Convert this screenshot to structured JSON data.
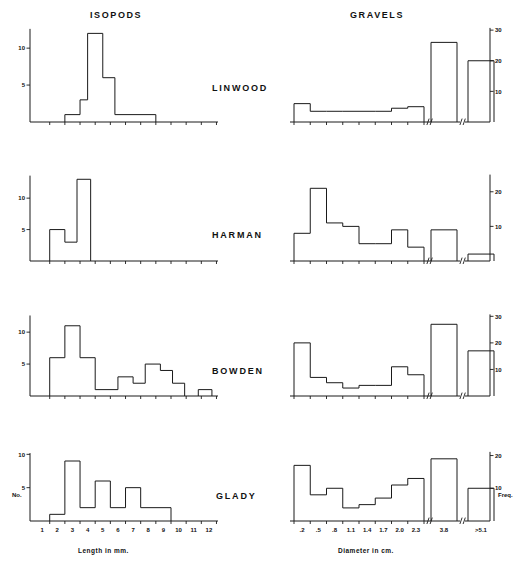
{
  "figure": {
    "column_titles": {
      "left": "ISOPODS",
      "right": "GRAVELS"
    },
    "sites": [
      "LINWOOD",
      "HARMAN",
      "BOWDEN",
      "GLADY"
    ],
    "left_axis_title": "Length in mm.",
    "right_axis_title": "Diameter in cm.",
    "left_y_label": "No.",
    "right_y_label": "Freq."
  },
  "chart_data": [
    {
      "type": "bar",
      "title": "ISOPODS",
      "site": "LINWOOD",
      "xlabel": "Length in mm.",
      "ylabel": "No.",
      "xlim": [
        0,
        12.5
      ],
      "ylim": [
        0,
        13
      ],
      "ytick_labels": [
        "5",
        "10"
      ],
      "ytick_values": [
        5,
        10
      ],
      "xtick_labels": [
        "1",
        "2",
        "3",
        "4",
        "5",
        "6",
        "7",
        "8",
        "9",
        "10",
        "11",
        "12"
      ],
      "bins": [
        {
          "start": 2.5,
          "end": 3.5,
          "value": 1
        },
        {
          "start": 3.5,
          "end": 4.0,
          "value": 3
        },
        {
          "start": 4.0,
          "end": 5.0,
          "value": 12
        },
        {
          "start": 5.0,
          "end": 5.8,
          "value": 6
        },
        {
          "start": 5.8,
          "end": 8.5,
          "value": 1
        }
      ]
    },
    {
      "type": "bar",
      "title": "GRAVELS",
      "site": "LINWOOD",
      "xlabel": "Diameter in cm.",
      "ylabel": "Freq.",
      "ylim": [
        0,
        32
      ],
      "ytick_labels": [
        "10",
        "20",
        "30"
      ],
      "ytick_values": [
        10,
        20,
        30
      ],
      "xtick_labels": [
        ".2",
        ".5",
        ".8",
        "1.1",
        "1.4",
        "1.7",
        "2.0",
        "2.3",
        "3.8",
        ">5.1"
      ],
      "axis_breaks": 2,
      "bins": [
        {
          "label": ".2",
          "value": 6
        },
        {
          "label": ".5",
          "value": 3.5
        },
        {
          "label": ".8",
          "value": 3.5
        },
        {
          "label": "1.1",
          "value": 3.5
        },
        {
          "label": "1.4",
          "value": 3.5
        },
        {
          "label": "1.7",
          "value": 3.5
        },
        {
          "label": "2.0",
          "value": 4.5
        },
        {
          "label": "2.3",
          "value": 5
        },
        {
          "label": "3.8",
          "value": 26
        },
        {
          "label": ">5.1",
          "value": 20
        }
      ]
    },
    {
      "type": "bar",
      "title": "ISOPODS",
      "site": "HARMAN",
      "xlabel": "Length in mm.",
      "ylabel": "No.",
      "xlim": [
        0,
        12.5
      ],
      "ylim": [
        0,
        14
      ],
      "ytick_labels": [
        "5",
        "10"
      ],
      "ytick_values": [
        5,
        10
      ],
      "bins": [
        {
          "start": 1.5,
          "end": 2.5,
          "value": 5
        },
        {
          "start": 2.5,
          "end": 3.3,
          "value": 3
        },
        {
          "start": 3.3,
          "end": 4.2,
          "value": 13
        }
      ]
    },
    {
      "type": "bar",
      "title": "GRAVELS",
      "site": "HARMAN",
      "xlabel": "Diameter in cm.",
      "ylabel": "Freq.",
      "ylim": [
        0,
        26
      ],
      "ytick_labels": [
        "10",
        "20"
      ],
      "ytick_values": [
        10,
        20
      ],
      "axis_breaks": 2,
      "bins": [
        {
          "label": ".2",
          "value": 8
        },
        {
          "label": ".5",
          "value": 21
        },
        {
          "label": ".8",
          "value": 11
        },
        {
          "label": "1.1",
          "value": 10
        },
        {
          "label": "1.4",
          "value": 5
        },
        {
          "label": "1.7",
          "value": 5
        },
        {
          "label": "2.0",
          "value": 9
        },
        {
          "label": "2.3",
          "value": 4
        },
        {
          "label": "3.8",
          "value": 9
        },
        {
          "label": ">5.1",
          "value": 2
        }
      ]
    },
    {
      "type": "bar",
      "title": "ISOPODS",
      "site": "BOWDEN",
      "xlabel": "Length in mm.",
      "ylabel": "No.",
      "xlim": [
        0,
        12.5
      ],
      "ylim": [
        0,
        13
      ],
      "ytick_labels": [
        "5",
        "10"
      ],
      "ytick_values": [
        5,
        10
      ],
      "bins": [
        {
          "start": 1.5,
          "end": 2.5,
          "value": 6
        },
        {
          "start": 2.5,
          "end": 3.5,
          "value": 11
        },
        {
          "start": 3.5,
          "end": 4.5,
          "value": 6
        },
        {
          "start": 4.5,
          "end": 6.0,
          "value": 1
        },
        {
          "start": 6.0,
          "end": 7.0,
          "value": 3
        },
        {
          "start": 7.0,
          "end": 7.8,
          "value": 2
        },
        {
          "start": 7.8,
          "end": 8.8,
          "value": 5
        },
        {
          "start": 8.8,
          "end": 9.6,
          "value": 4
        },
        {
          "start": 9.6,
          "end": 10.4,
          "value": 2
        },
        {
          "start": 11.3,
          "end": 12.2,
          "value": 1
        }
      ]
    },
    {
      "type": "bar",
      "title": "GRAVELS",
      "site": "BOWDEN",
      "xlabel": "Diameter in cm.",
      "ylabel": "Freq.",
      "ylim": [
        0,
        32
      ],
      "ytick_labels": [
        "10",
        "20",
        "30"
      ],
      "ytick_values": [
        10,
        20,
        30
      ],
      "axis_breaks": 2,
      "bins": [
        {
          "label": ".2",
          "value": 20
        },
        {
          "label": ".5",
          "value": 7
        },
        {
          "label": ".8",
          "value": 5
        },
        {
          "label": "1.1",
          "value": 3
        },
        {
          "label": "1.4",
          "value": 4
        },
        {
          "label": "1.7",
          "value": 4
        },
        {
          "label": "2.0",
          "value": 11
        },
        {
          "label": "2.3",
          "value": 8
        },
        {
          "label": "3.8",
          "value": 27
        },
        {
          "label": ">5.1",
          "value": 17
        }
      ]
    },
    {
      "type": "bar",
      "title": "ISOPODS",
      "site": "GLADY",
      "xlabel": "Length in mm.",
      "ylabel": "No.",
      "xlim": [
        0,
        12.5
      ],
      "ylim": [
        0,
        10.5
      ],
      "ytick_labels": [
        "5",
        "10"
      ],
      "ytick_values": [
        5,
        10
      ],
      "bins": [
        {
          "start": 1.5,
          "end": 2.5,
          "value": 1
        },
        {
          "start": 2.5,
          "end": 3.5,
          "value": 9
        },
        {
          "start": 3.5,
          "end": 4.5,
          "value": 2
        },
        {
          "start": 4.5,
          "end": 5.5,
          "value": 6
        },
        {
          "start": 5.5,
          "end": 6.5,
          "value": 2
        },
        {
          "start": 6.5,
          "end": 7.5,
          "value": 5
        },
        {
          "start": 7.5,
          "end": 9.5,
          "value": 2
        }
      ]
    },
    {
      "type": "bar",
      "title": "GRAVELS",
      "site": "GLADY",
      "xlabel": "Diameter in cm.",
      "ylabel": "Freq.",
      "ylim": [
        0,
        22
      ],
      "ytick_labels": [
        "10",
        "20"
      ],
      "ytick_values": [
        10,
        20
      ],
      "axis_breaks": 2,
      "bins": [
        {
          "label": ".2",
          "value": 17
        },
        {
          "label": ".5",
          "value": 8
        },
        {
          "label": ".8",
          "value": 10
        },
        {
          "label": "1.1",
          "value": 4
        },
        {
          "label": "1.4",
          "value": 5
        },
        {
          "label": "1.7",
          "value": 7
        },
        {
          "label": "2.0",
          "value": 11
        },
        {
          "label": "2.3",
          "value": 13
        },
        {
          "label": "3.8",
          "value": 19
        },
        {
          "label": ">5.1",
          "value": 10
        }
      ]
    }
  ]
}
